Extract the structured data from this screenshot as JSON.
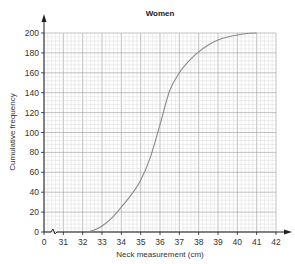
{
  "chart_data": {
    "type": "line",
    "title": "Women",
    "xlabel": "Neck measurement (cm)",
    "ylabel": "Cumulative frequency",
    "x_ticks": [
      "0",
      "31",
      "32",
      "33",
      "34",
      "35",
      "36",
      "37",
      "38",
      "39",
      "40",
      "41",
      "42"
    ],
    "y_ticks": [
      "0",
      "20",
      "40",
      "60",
      "80",
      "100",
      "120",
      "140",
      "160",
      "180",
      "200"
    ],
    "xlim": [
      30,
      42
    ],
    "ylim": [
      0,
      200
    ],
    "axis_break": true,
    "grid": true,
    "series": [
      {
        "name": "Cumulative frequency curve",
        "x": [
          32.2,
          32.6,
          33.0,
          33.5,
          34.0,
          34.5,
          35.0,
          35.5,
          36.0,
          36.5,
          37.0,
          37.5,
          38.0,
          38.5,
          39.0,
          39.5,
          40.0,
          40.5,
          41.0
        ],
        "y": [
          0,
          2,
          6,
          14,
          25,
          37,
          52,
          75,
          108,
          142,
          160,
          172,
          181,
          188,
          193,
          196,
          198,
          199.5,
          200
        ]
      }
    ]
  },
  "colors": {
    "grid_minor": "#d6d6d6",
    "grid_major": "#a9a9a9",
    "curve": "#8a8a8a",
    "axis": "#222222"
  }
}
